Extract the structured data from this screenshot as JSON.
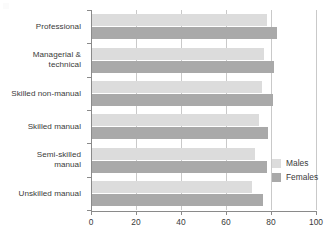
{
  "chart_data": {
    "type": "bar",
    "orientation": "horizontal",
    "title": "",
    "xlabel": "",
    "ylabel": "",
    "xlim": [
      0,
      100
    ],
    "xticks": [
      0,
      20,
      40,
      60,
      80,
      100
    ],
    "xtick_labels": [
      "0",
      "20",
      "40",
      "60",
      "80",
      "100"
    ],
    "grid": true,
    "grid_axis": "x",
    "legend_position": "right-middle",
    "categories": [
      "Professional",
      "Managerial & technical",
      "Skilled non-manual",
      "Skilled manual",
      "Semi-skilled manual",
      "Unskilled manual"
    ],
    "category_lines": [
      [
        "Professional"
      ],
      [
        "Managerial &",
        "technical"
      ],
      [
        "Skilled non-manual"
      ],
      [
        "Skilled manual"
      ],
      [
        "Semi-skilled",
        "manual"
      ],
      [
        "Unskilled manual"
      ]
    ],
    "series": [
      {
        "name": "Males",
        "color": "#dcdcdc",
        "values": [
          78,
          77,
          76,
          74.5,
          73,
          71.5
        ]
      },
      {
        "name": "Females",
        "color": "#a9a9a9",
        "values": [
          82.5,
          81.5,
          81,
          78.5,
          78,
          76.5
        ]
      }
    ]
  },
  "legend": {
    "items": [
      {
        "label": "Males",
        "color": "#dcdcdc"
      },
      {
        "label": "Females",
        "color": "#a9a9a9"
      }
    ]
  },
  "colors": {
    "males": "#dcdcdc",
    "females": "#a9a9a9",
    "axis": "#8a8a8a",
    "grid": "#c9c9c9",
    "text": "#3a3a3a",
    "background": "#ffffff"
  }
}
